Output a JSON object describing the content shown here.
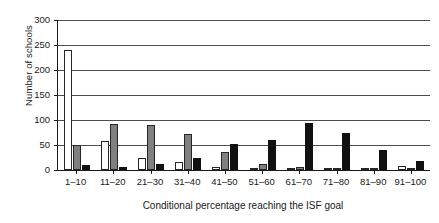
{
  "chart_data": {
    "type": "bar",
    "title": "",
    "xlabel": "Conditional percentage reaching the ISF goal",
    "ylabel": "Number of schools",
    "categories": [
      "1–10",
      "11–20",
      "21–30",
      "31–40",
      "41–50",
      "51–60",
      "61–70",
      "71–80",
      "81–90",
      "91–100"
    ],
    "ylim": [
      0,
      300
    ],
    "yticks": [
      0,
      50,
      100,
      150,
      200,
      250,
      300
    ],
    "ytick_labels": [
      "0",
      "50",
      "100",
      "150",
      "200",
      "250",
      "300"
    ],
    "grid": true,
    "legend": "none",
    "series": [
      {
        "name": "series-white",
        "color": "#ffffff",
        "values": [
          240,
          58,
          25,
          17,
          7,
          5,
          2,
          4,
          1,
          8
        ]
      },
      {
        "name": "series-gray",
        "color": "#808080",
        "values": [
          50,
          93,
          90,
          72,
          37,
          13,
          7,
          5,
          2,
          0
        ]
      },
      {
        "name": "series-black",
        "color": "#111111",
        "values": [
          10,
          7,
          13,
          24,
          53,
          60,
          95,
          74,
          40,
          18
        ]
      }
    ]
  }
}
